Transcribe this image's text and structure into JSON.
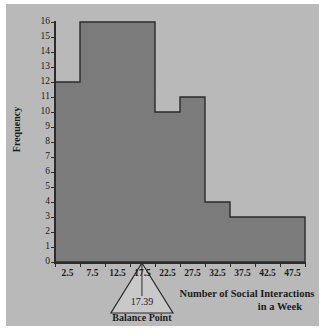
{
  "chart_data": {
    "type": "bar",
    "title": "",
    "subtitle": "",
    "xlabel_line1": "Number of Social Interactions",
    "xlabel_line2": "in a Week",
    "ylabel": "Frequency",
    "grid": false,
    "legend": "none",
    "xlim": [
      0,
      50
    ],
    "ylim": [
      0,
      16
    ],
    "bin_width": 5,
    "bin_edges": [
      0,
      5,
      10,
      15,
      20,
      25,
      30,
      35,
      40,
      45,
      50
    ],
    "categories": [
      "0-5",
      "5-10",
      "10-15",
      "15-20",
      "20-25",
      "25-30",
      "30-35",
      "35-40",
      "40-45",
      "45-50"
    ],
    "bin_midpoints": [
      2.5,
      7.5,
      12.5,
      17.5,
      22.5,
      27.5,
      32.5,
      37.5,
      42.5,
      47.5
    ],
    "values": [
      12,
      16,
      16,
      16,
      10,
      11,
      4,
      3,
      3,
      3
    ],
    "x_tick_labels": [
      "2.5",
      "7.5",
      "12.5",
      "17.5",
      "22.5",
      "27.5",
      "32.5",
      "37.5",
      "42.5",
      "47.5"
    ],
    "y_tick_labels": [
      "0",
      "1",
      "2",
      "3",
      "4",
      "5",
      "6",
      "7",
      "8",
      "9",
      "10",
      "11",
      "12",
      "13",
      "14",
      "15",
      "16"
    ],
    "y_tick_values": [
      0,
      1,
      2,
      3,
      4,
      5,
      6,
      7,
      8,
      9,
      10,
      11,
      12,
      13,
      14,
      15,
      16
    ],
    "annotations": [
      {
        "name": "balance-point",
        "value": "17.39",
        "caption": "Balance Point",
        "x": 17.39,
        "marker": "triangle-fulcrum"
      }
    ],
    "colors": {
      "bar_fill": "#7b7b7b",
      "bar_edge": "#2b2b2b",
      "plot_background": "#b9b9b9",
      "page_background": "#ffffff",
      "axis": "#2b2b2b",
      "text": "#1c1c1c",
      "annotation_fill": "#c9c9c9"
    }
  }
}
